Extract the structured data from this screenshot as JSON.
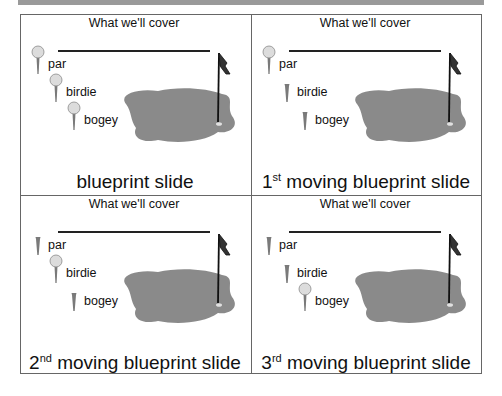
{
  "panels": [
    {
      "heading": "What we'll cover",
      "title_prefix": "",
      "title_sup": "",
      "title_text": "blueprint slide",
      "items": [
        {
          "label": "par",
          "has_ball": true
        },
        {
          "label": "birdie",
          "has_ball": true
        },
        {
          "label": "bogey",
          "has_ball": true
        }
      ]
    },
    {
      "heading": "What we'll cover",
      "title_prefix": "1",
      "title_sup": "st",
      "title_text": " moving blueprint slide",
      "items": [
        {
          "label": "par",
          "has_ball": true
        },
        {
          "label": "birdie",
          "has_ball": false
        },
        {
          "label": "bogey",
          "has_ball": false
        }
      ]
    },
    {
      "heading": "What we'll cover",
      "title_prefix": "2",
      "title_sup": "nd",
      "title_text": " moving blueprint slide",
      "items": [
        {
          "label": "par",
          "has_ball": false
        },
        {
          "label": "birdie",
          "has_ball": true
        },
        {
          "label": "bogey",
          "has_ball": false
        }
      ]
    },
    {
      "heading": "What we'll cover",
      "title_prefix": "3",
      "title_sup": "rd",
      "title_text": " moving blueprint slide",
      "items": [
        {
          "label": "par",
          "has_ball": false
        },
        {
          "label": "birdie",
          "has_ball": false
        },
        {
          "label": "bogey",
          "has_ball": true
        }
      ]
    }
  ],
  "colors": {
    "green": "#8a8a8a",
    "ball": "#dcdcdc",
    "tee": "#7a7a7a",
    "border": "#666666"
  }
}
